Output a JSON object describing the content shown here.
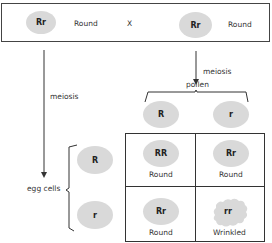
{
  "parents": {
    "left": {
      "genotype": "Rr",
      "phenotype": "Round"
    },
    "cross_symbol": "X",
    "right": {
      "genotype": "Rr",
      "phenotype": "Round"
    }
  },
  "labels": {
    "meiosis_left": "meiosis",
    "meiosis_right": "meiosis",
    "pollen": "pollen",
    "egg_cells": "egg cells"
  },
  "pollen": [
    "R",
    "r"
  ],
  "egg_cells": [
    "R",
    "r"
  ],
  "punnett": [
    [
      {
        "genotype": "RR",
        "phenotype": "Round"
      },
      {
        "genotype": "Rr",
        "phenotype": "Round"
      }
    ],
    [
      {
        "genotype": "Rr",
        "phenotype": "Round"
      },
      {
        "genotype": "rr",
        "phenotype": "Wrinkled"
      }
    ]
  ],
  "colors": {
    "oval": "#d9d9d9",
    "line": "#333333"
  }
}
